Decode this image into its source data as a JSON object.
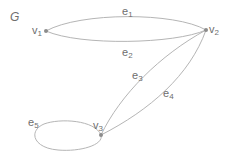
{
  "graph": {
    "name": "G",
    "vertices": [
      {
        "id": "v1",
        "base": "v",
        "sub": "1",
        "x": 46,
        "y": 31
      },
      {
        "id": "v2",
        "base": "v",
        "sub": "2",
        "x": 206,
        "y": 30
      },
      {
        "id": "v3",
        "base": "v",
        "sub": "3",
        "x": 101,
        "y": 135
      }
    ],
    "edges": [
      {
        "id": "e1",
        "base": "e",
        "sub": "1",
        "from": "v1",
        "to": "v2"
      },
      {
        "id": "e2",
        "base": "e",
        "sub": "2",
        "from": "v1",
        "to": "v2"
      },
      {
        "id": "e3",
        "base": "e",
        "sub": "3",
        "from": "v2",
        "to": "v3"
      },
      {
        "id": "e4",
        "base": "e",
        "sub": "4",
        "from": "v2",
        "to": "v3"
      },
      {
        "id": "e5",
        "base": "e",
        "sub": "5",
        "from": "v3",
        "to": "v3"
      }
    ],
    "colors": {
      "edge": "#b5b5b5",
      "vertex": "#8c8c8c",
      "label": "#6e6e6e"
    }
  }
}
